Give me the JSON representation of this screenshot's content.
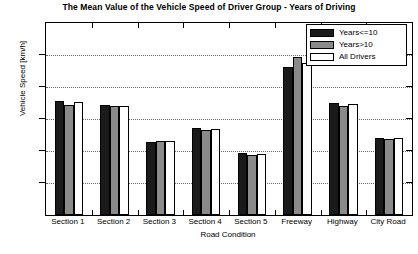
{
  "chart_data": {
    "type": "bar",
    "title": "The Mean Value of the Vehicle Speed of Driver Group - Years of Driving",
    "xlabel": "Road Condition",
    "ylabel": "Vehicle Speed [km/h]",
    "ylim": [
      0,
      120
    ],
    "yticks": [
      0,
      20,
      40,
      60,
      80,
      100,
      120
    ],
    "ytick_labels": [
      "0",
      "20",
      "40",
      "60",
      "80",
      "100",
      "120"
    ],
    "grid": true,
    "legend_position": "top-right",
    "categories": [
      "Section 1",
      "Section 2",
      "Section 3",
      "Section 4",
      "Section 5",
      "Freeway",
      "Highway",
      "City Road"
    ],
    "series": [
      {
        "name": "Years<=10",
        "color": "#1a1a1a",
        "values": [
          71.2,
          68.7,
          45.5,
          54.6,
          39.0,
          92.6,
          70.3,
          48.0
        ]
      },
      {
        "name": "Years>10",
        "color": "#8a8a8a",
        "values": [
          69.0,
          68.0,
          46.0,
          53.3,
          37.7,
          98.9,
          68.2,
          47.2
        ]
      },
      {
        "name": "All Drivers",
        "color": "#ffffff",
        "values": [
          70.6,
          68.4,
          46.0,
          54.0,
          38.2,
          94.8,
          69.6,
          47.9
        ]
      }
    ]
  }
}
